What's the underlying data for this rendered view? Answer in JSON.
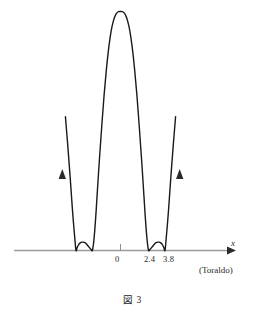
{
  "figure": {
    "caption": "図 3",
    "attribution": "(Toraldo)",
    "axis_label_x": "x"
  },
  "axis": {
    "tick_labels": [
      "0",
      "2.4",
      "3.8"
    ],
    "line_color": "#9a9a9a",
    "arrow_color": "#2b2b2b"
  },
  "curve": {
    "color": "#1a1a1a",
    "stroke_width": 1.4
  },
  "chart_data": {
    "type": "line",
    "title": "図 3",
    "xlabel": "x",
    "ylabel": "",
    "grid": false,
    "legend": null,
    "annotations": [
      "(Toraldo)"
    ],
    "x_tick_values": [
      0,
      2.4,
      3.8
    ],
    "x_tick_labels": [
      "0",
      "2.4",
      "3.8"
    ],
    "xlim": [
      -5.6,
      6.4
    ],
    "ylim": [
      0,
      1.05
    ],
    "tangency_points_x": [
      -3.8,
      -2.4,
      2.4,
      3.8
    ],
    "local_maxima_x": [
      -3.1,
      0,
      3.1
    ],
    "local_maxima_y": [
      0.035,
      1.0,
      0.035
    ],
    "peak": {
      "x": 0,
      "y": 1.0
    },
    "arrows": [
      {
        "x": -4.55,
        "y": 0.37,
        "direction": "up"
      },
      {
        "x": 4.55,
        "y": 0.37,
        "direction": "up"
      }
    ],
    "x": [
      -4.7,
      -4.6,
      -4.5,
      -4.4,
      -4.3,
      -4.2,
      -4.1,
      -4.0,
      -3.9,
      -3.8,
      -3.7,
      -3.6,
      -3.5,
      -3.4,
      -3.3,
      -3.2,
      -3.1,
      -3.0,
      -2.9,
      -2.8,
      -2.7,
      -2.6,
      -2.5,
      -2.4,
      -2.3,
      -2.2,
      -2.1,
      -2.0,
      -1.8,
      -1.6,
      -1.4,
      -1.2,
      -1.0,
      -0.8,
      -0.6,
      -0.4,
      -0.2,
      0.0,
      0.2,
      0.4,
      0.6,
      0.8,
      1.0,
      1.2,
      1.4,
      1.6,
      1.8,
      2.0,
      2.1,
      2.2,
      2.3,
      2.4,
      2.5,
      2.6,
      2.7,
      2.8,
      2.9,
      3.0,
      3.1,
      3.2,
      3.3,
      3.4,
      3.5,
      3.6,
      3.7,
      3.8,
      3.9,
      4.0,
      4.1,
      4.2,
      4.3,
      4.4,
      4.5,
      4.6,
      4.7
    ],
    "y": [
      0.56,
      0.5,
      0.44,
      0.375,
      0.31,
      0.24,
      0.17,
      0.108,
      0.052,
      0.0,
      0.012,
      0.022,
      0.029,
      0.033,
      0.035,
      0.035,
      0.034,
      0.032,
      0.027,
      0.021,
      0.015,
      0.009,
      0.004,
      0.0,
      0.03,
      0.082,
      0.15,
      0.228,
      0.38,
      0.52,
      0.65,
      0.76,
      0.85,
      0.918,
      0.962,
      0.988,
      0.999,
      1.0,
      0.999,
      0.988,
      0.962,
      0.918,
      0.85,
      0.76,
      0.65,
      0.52,
      0.38,
      0.228,
      0.15,
      0.082,
      0.03,
      0.0,
      0.004,
      0.009,
      0.015,
      0.021,
      0.027,
      0.032,
      0.034,
      0.035,
      0.035,
      0.033,
      0.029,
      0.022,
      0.012,
      0.0,
      0.052,
      0.108,
      0.17,
      0.24,
      0.31,
      0.375,
      0.44,
      0.5,
      0.56
    ]
  }
}
